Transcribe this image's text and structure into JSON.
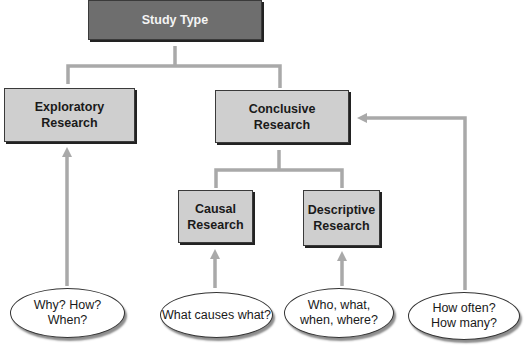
{
  "diagram": {
    "root": {
      "label": "Study Type"
    },
    "nodes": {
      "exploratory": {
        "label": "Exploratory\nResearch"
      },
      "conclusive": {
        "label": "Conclusive\nResearch"
      },
      "causal": {
        "label": "Causal\nResearch"
      },
      "descriptive": {
        "label": "Descriptive\nResearch"
      }
    },
    "questions": {
      "exploratory": {
        "label": "Why? How?\nWhen?"
      },
      "causal": {
        "label": "What causes what?"
      },
      "descriptive": {
        "label": "Who, what,\nwhen, where?"
      },
      "conclusive": {
        "label": "How often?\nHow many?"
      }
    },
    "colors": {
      "root_fill": "#6e6e6e",
      "node_fill": "#cfcfcf",
      "connector": "#a9a9a9",
      "ellipse_fill": "#ffffff"
    }
  }
}
